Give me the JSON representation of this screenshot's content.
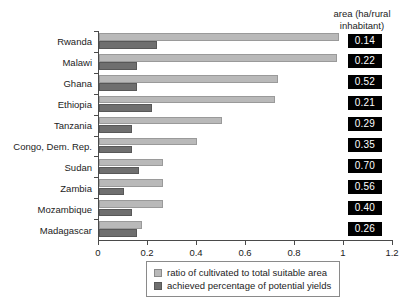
{
  "chart_data": {
    "type": "bar",
    "orientation": "horizontal",
    "title": "",
    "subtitle": "",
    "xlabel": "",
    "ylabel": "",
    "xlim": [
      0,
      1.2
    ],
    "xticks": [
      0,
      0.2,
      0.4,
      0.6,
      0.8,
      1,
      1.2
    ],
    "xtick_labels": [
      "0",
      "0.2",
      "0.4",
      "0.6",
      "0.8",
      "1",
      "1.2"
    ],
    "grid": false,
    "legend_position": "bottom",
    "categories": [
      "Rwanda",
      "Malawi",
      "Ghana",
      "Ethiopia",
      "Tanzania",
      "Congo, Dem. Rep.",
      "Sudan",
      "Zambia",
      "Mozambique",
      "Madagascar"
    ],
    "series": [
      {
        "name": "ratio of cultivated to total suitable area",
        "color": "#b9b9b9",
        "values": [
          0.98,
          0.97,
          0.73,
          0.72,
          0.5,
          0.4,
          0.26,
          0.26,
          0.26,
          0.175
        ]
      },
      {
        "name": "achieved percentage of potential yields",
        "color": "#6f6f6f",
        "values": [
          0.235,
          0.155,
          0.155,
          0.215,
          0.135,
          0.135,
          0.165,
          0.1,
          0.135,
          0.155
        ]
      }
    ],
    "annotation_column": {
      "header_line1": "area (ha/rural",
      "header_line2": "inhabitant)",
      "values": [
        "0.14",
        "0.22",
        "0.52",
        "0.21",
        "0.29",
        "0.35",
        "0.70",
        "0.56",
        "0.40",
        "0.26"
      ]
    }
  }
}
